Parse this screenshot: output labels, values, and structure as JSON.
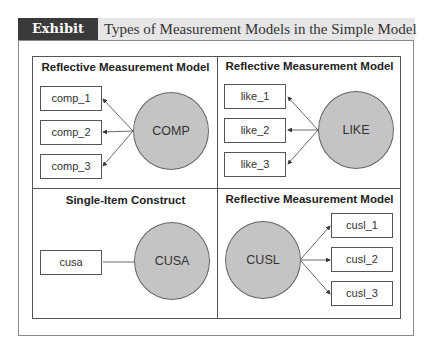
{
  "header": {
    "exhibit_label": "Exhibit 2.14",
    "title": "Types of Measurement Models in the Simple Model"
  },
  "quadrants": [
    {
      "title": "Reflective Measurement Model",
      "construct": "COMP",
      "indicators": [
        "comp_1",
        "comp_2",
        "comp_3"
      ],
      "arrow_direction": "construct-to-indicators"
    },
    {
      "title": "Reflective Measurement Model",
      "construct": "LIKE",
      "indicators": [
        "like_1",
        "like_2",
        "like_3"
      ],
      "arrow_direction": "construct-to-indicators"
    },
    {
      "title": "Single-Item Construct",
      "construct": "CUSA",
      "indicators": [
        "cusa"
      ],
      "arrow_direction": "none"
    },
    {
      "title": "Reflective Measurement Model",
      "construct": "CUSL",
      "indicators": [
        "cusl_1",
        "cusl_2",
        "cusl_3"
      ],
      "arrow_direction": "construct-to-indicators"
    }
  ],
  "colors": {
    "label_bg": "#3a3a3a",
    "header_bg": "#e6e6e6",
    "construct_fill": "#c4c4c4",
    "line": "#555555"
  }
}
